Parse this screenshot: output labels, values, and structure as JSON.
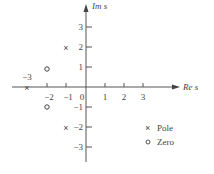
{
  "diagram": {
    "type": "pole-zero plot",
    "x_axis_label": "Re s",
    "y_axis_label": "Im s",
    "x_ticks": [
      "−2",
      "−1",
      "0",
      "1",
      "2",
      "3"
    ],
    "y_ticks_pos": [
      "1",
      "2",
      "3"
    ],
    "y_ticks_neg": [
      "−1",
      "−2",
      "−3"
    ],
    "neg3_label": "−3",
    "pole_symbol": "×",
    "zero_symbol": "o",
    "poles": [
      {
        "re": -3,
        "im": 0
      },
      {
        "re": -1,
        "im": 2
      },
      {
        "re": -1,
        "im": -2
      }
    ],
    "zeros": [
      {
        "re": -2,
        "im": 1
      },
      {
        "re": -2,
        "im": -1
      }
    ],
    "legend": [
      {
        "symbol": "×",
        "label": "Pole"
      },
      {
        "symbol": "o",
        "label": "Zero"
      }
    ]
  }
}
